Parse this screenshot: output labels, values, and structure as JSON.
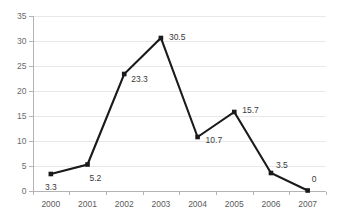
{
  "chart_data": {
    "type": "line",
    "title": "",
    "subtitle": "",
    "xlabel": "",
    "ylabel": "",
    "categories": [
      "2000",
      "2001",
      "2002",
      "2003",
      "2004",
      "2005",
      "2006",
      "2007"
    ],
    "values": [
      3.3,
      5.2,
      23.3,
      30.5,
      10.7,
      15.7,
      3.5,
      0
    ],
    "point_labels": [
      "3.3",
      "5.2",
      "23.3",
      "30.5",
      "10.7",
      "15.7",
      "3.5",
      "0"
    ],
    "series": [
      {
        "name": "",
        "values": [
          3.3,
          5.2,
          23.3,
          30.5,
          10.7,
          15.7,
          3.5,
          0
        ]
      }
    ],
    "ylim": [
      0,
      35
    ],
    "ytick_values": [
      0,
      5,
      10,
      15,
      20,
      25,
      30,
      35
    ],
    "ytick_labels": [
      "0",
      "5",
      "10",
      "15",
      "20",
      "25",
      "30",
      "35"
    ],
    "xtick_labels": [
      "2000",
      "2001",
      "2002",
      "2003",
      "2004",
      "2005",
      "2006",
      "2007"
    ],
    "grid": true,
    "grid_axis": "y",
    "legend": false,
    "legend_position": "none",
    "marker": "square",
    "annotations": [],
    "colors": {
      "line": "#1a1a1a",
      "marker": "#1a1a1a",
      "grid": "#e8e8e8",
      "axis": "#b4b4b4",
      "tick_text": "#6b6b6b",
      "label_text": "#3a3a3a",
      "background": "#ffffff"
    }
  }
}
